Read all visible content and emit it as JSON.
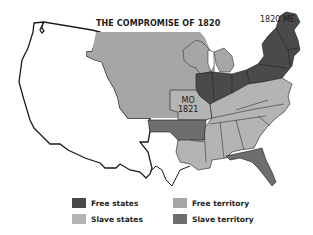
{
  "map": {
    "title": "THE COMPROMISE OF 1820",
    "labels": {
      "maine": "1820 ME",
      "missouri_line1": "MO",
      "missouri_line2": "1821"
    },
    "regions": [
      {
        "name": "Unorganized western territory",
        "category": "none"
      },
      {
        "name": "Louisiana Purchase northern territory",
        "category": "free_territory"
      },
      {
        "name": "Michigan/Wisconsin territory",
        "category": "free_territory"
      },
      {
        "name": "Northern states (IL, IN, OH, PA, NY, New England)",
        "category": "free_states"
      },
      {
        "name": "Maine",
        "category": "free_states"
      },
      {
        "name": "Missouri",
        "category": "slave_states"
      },
      {
        "name": "Southern states (KY, TN, VA, NC, SC, GA, AL, MS, LA)",
        "category": "slave_states"
      },
      {
        "name": "Arkansas territory",
        "category": "slave_territory"
      },
      {
        "name": "Florida territory",
        "category": "slave_territory"
      }
    ]
  },
  "legend": {
    "items": [
      {
        "key": "free_states",
        "label": "Free states",
        "color": "#4a4a4a"
      },
      {
        "key": "slave_states",
        "label": "Slave states",
        "color": "#b4b4b4"
      },
      {
        "key": "free_territory",
        "label": "Free territory",
        "color": "#a6a6a6"
      },
      {
        "key": "slave_territory",
        "label": "Slave territory",
        "color": "#6e6e6e"
      }
    ]
  },
  "colors": {
    "outline": "#1a1a1a",
    "background": "#ffffff",
    "free_states": "#4a4a4a",
    "slave_states": "#b4b4b4",
    "free_territory": "#a6a6a6",
    "slave_territory": "#6e6e6e"
  }
}
